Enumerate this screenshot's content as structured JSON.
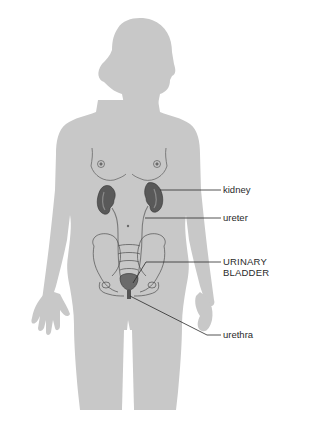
{
  "diagram": {
    "colors": {
      "silhouette": "#c8c8c8",
      "kidney": "#5a5a5a",
      "outline": "#4a4a4a",
      "leader": "#2a2a2a",
      "text": "#2a2a2a"
    },
    "labels": [
      {
        "id": "kidney",
        "text": "kidney"
      },
      {
        "id": "ureter",
        "text": "ureter"
      },
      {
        "id": "bladder",
        "line1": "URINARY",
        "line2": "BLADDER"
      },
      {
        "id": "urethra",
        "text": "urethra"
      }
    ]
  }
}
